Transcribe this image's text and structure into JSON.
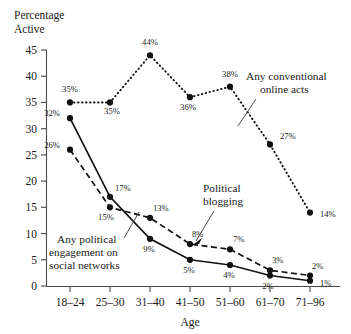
{
  "chart_data": {
    "type": "line",
    "title": "",
    "ylabel_lines": [
      "Percentage",
      "Active"
    ],
    "xlabel": "Age",
    "categories": [
      "18–24",
      "25–30",
      "31–40",
      "41–50",
      "51–60",
      "61–70",
      "71–96"
    ],
    "ylim": [
      0,
      45
    ],
    "yticks": [
      0,
      5,
      10,
      15,
      20,
      25,
      30,
      35,
      40,
      45
    ],
    "ytick_labels": [
      "0",
      "5",
      "10",
      "15",
      "20",
      "25",
      "30",
      "35",
      "40",
      "45"
    ],
    "grid": false,
    "legend": "annotations",
    "series": [
      {
        "name": "Any conventional online acts",
        "style": "dotted",
        "values": [
          35,
          35,
          44,
          36,
          38,
          27,
          14
        ],
        "labels": [
          "35%",
          "35%",
          "44%",
          "36%",
          "38%",
          "27%",
          "14%"
        ]
      },
      {
        "name": "Any political engagement on social networks",
        "style": "solid",
        "values": [
          32,
          17,
          9,
          5,
          4,
          2,
          1
        ],
        "labels": [
          "32%",
          "17%",
          "9%",
          "5%",
          "4%",
          "2%",
          "1%"
        ]
      },
      {
        "name": "Political blogging",
        "style": "dashed",
        "values": [
          26,
          15,
          13,
          8,
          7,
          3,
          2
        ],
        "labels": [
          "26%",
          "15%",
          "13%",
          "8%",
          "7%",
          "3%",
          "2%"
        ]
      }
    ],
    "annotations": [
      {
        "text_lines": [
          "Any conventional",
          "online acts"
        ],
        "series": "Any conventional online acts"
      },
      {
        "text_lines": [
          "Political",
          "blogging"
        ],
        "series": "Political blogging"
      },
      {
        "text_lines": [
          "Any political",
          "engagement on",
          "social networks"
        ],
        "series": "Any political engagement on social networks"
      }
    ]
  },
  "colors": {
    "ink": "#111111",
    "axis": "#4a4a4a",
    "background": "#ffffff"
  }
}
